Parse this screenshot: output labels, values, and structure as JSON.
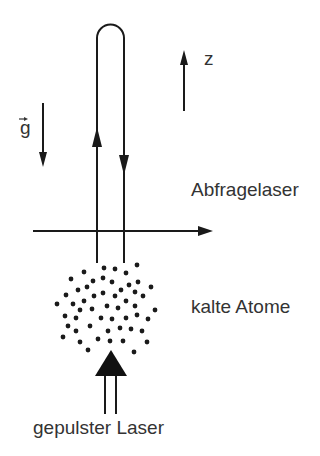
{
  "labels": {
    "gravity": "g",
    "z_axis": "z",
    "probe_laser": "Abfragelaser",
    "cold_atoms": "kalte Atome",
    "pulsed_laser": "gepulster Laser"
  },
  "colors": {
    "stroke": "#1a1a1a",
    "text": "#333333",
    "background": "#ffffff"
  },
  "atoms": [
    [
      104,
      268
    ],
    [
      115,
      269
    ],
    [
      137,
      265
    ],
    [
      84,
      272
    ],
    [
      126,
      273
    ],
    [
      71,
      279
    ],
    [
      103,
      278
    ],
    [
      93,
      281
    ],
    [
      112,
      282
    ],
    [
      138,
      282
    ],
    [
      129,
      285
    ],
    [
      151,
      287
    ],
    [
      87,
      287
    ],
    [
      78,
      290
    ],
    [
      121,
      290
    ],
    [
      135,
      292
    ],
    [
      66,
      295
    ],
    [
      103,
      293
    ],
    [
      94,
      296
    ],
    [
      115,
      296
    ],
    [
      143,
      296
    ],
    [
      84,
      301
    ],
    [
      126,
      301
    ],
    [
      57,
      304
    ],
    [
      73,
      304
    ],
    [
      107,
      306
    ],
    [
      118,
      308
    ],
    [
      135,
      306
    ],
    [
      80,
      310
    ],
    [
      92,
      309
    ],
    [
      155,
      310
    ],
    [
      65,
      316
    ],
    [
      76,
      318
    ],
    [
      101,
      318
    ],
    [
      112,
      319
    ],
    [
      126,
      318
    ],
    [
      137,
      315
    ],
    [
      148,
      319
    ],
    [
      68,
      326
    ],
    [
      90,
      326
    ],
    [
      120,
      328
    ],
    [
      76,
      331
    ],
    [
      108,
      331
    ],
    [
      131,
      329
    ],
    [
      142,
      331
    ],
    [
      63,
      337
    ],
    [
      98,
      339
    ],
    [
      110,
      341
    ],
    [
      123,
      341
    ],
    [
      80,
      342
    ],
    [
      147,
      342
    ],
    [
      88,
      350
    ],
    [
      134,
      352
    ]
  ]
}
